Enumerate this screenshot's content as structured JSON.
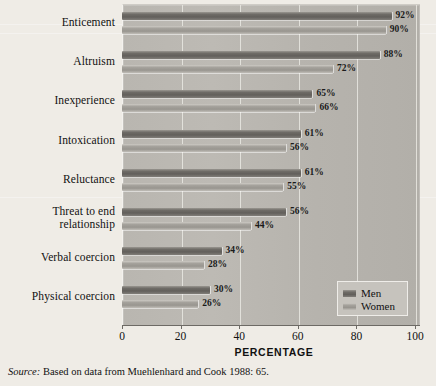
{
  "chart_data": {
    "type": "bar",
    "orientation": "horizontal",
    "title": "",
    "xlabel": "PERCENTAGE",
    "ylabel": "",
    "xlim": [
      0,
      100
    ],
    "xticks": [
      0,
      20,
      40,
      60,
      80,
      100
    ],
    "xtick_labels": [
      "0",
      "20",
      "40",
      "60",
      "80",
      "100"
    ],
    "grid": true,
    "grid_axis": "x",
    "legend_position": "bottom-right",
    "categories": [
      "Enticement",
      "Altruism",
      "Inexperience",
      "Intoxication",
      "Reluctance",
      "Threat to end\nrelationship",
      "Verbal coercion",
      "Physical coercion"
    ],
    "series": [
      {
        "name": "Men",
        "color": "#6f6c67",
        "values": [
          92,
          88,
          65,
          61,
          61,
          56,
          34,
          30
        ],
        "value_labels": [
          "92%",
          "88%",
          "65%",
          "61%",
          "61%",
          "56%",
          "34%",
          "30%"
        ]
      },
      {
        "name": "Women",
        "color": "#a5a29c",
        "values": [
          90,
          72,
          66,
          56,
          55,
          44,
          28,
          26
        ],
        "value_labels": [
          "90%",
          "72%",
          "66%",
          "56%",
          "55%",
          "44%",
          "28%",
          "26%"
        ]
      }
    ]
  },
  "axis": {
    "x_title": "PERCENTAGE",
    "tick_labels": [
      "0",
      "20",
      "40",
      "60",
      "80",
      "100"
    ]
  },
  "legend": {
    "items": [
      {
        "label": "Men",
        "swatch": "men"
      },
      {
        "label": "Women",
        "swatch": "women"
      }
    ]
  },
  "source_note": {
    "prefix": "Source:",
    "text": " Based on data from Muehlenhard and Cook 1988: 65."
  },
  "colors": {
    "men_bar": "#6f6c67",
    "women_bar": "#a5a29c",
    "plot_background": "#b9b6b0",
    "page_background": "#efece6",
    "legend_background": "#c6c3bd",
    "axis": "#6d6a65",
    "gridline": "#e9e7e2",
    "text": "#111111"
  }
}
